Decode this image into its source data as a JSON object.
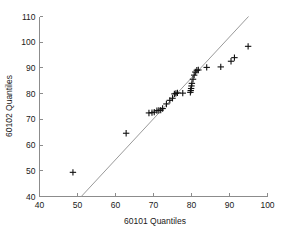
{
  "chart_data": {
    "type": "scatter",
    "title": "",
    "xlabel": "60101 Quantiles",
    "ylabel": "60102 Quantiles",
    "xlim": [
      40,
      100
    ],
    "ylim": [
      40,
      110
    ],
    "xticks": [
      40,
      50,
      60,
      70,
      80,
      90,
      100
    ],
    "yticks": [
      40,
      50,
      60,
      70,
      80,
      90,
      100,
      110
    ],
    "xtick_labels": [
      "40",
      "50",
      "60",
      "70",
      "80",
      "90",
      "100"
    ],
    "ytick_labels": [
      "40",
      "50",
      "60",
      "70",
      "80",
      "90",
      "100",
      "110"
    ],
    "grid": false,
    "legend": "none",
    "marker_style": "plus",
    "marker_color": "#111111",
    "reference_line": {
      "label": "quantile reference line",
      "color": "#9a9a9a",
      "x": [
        51.0,
        95.0
      ],
      "y": [
        40.0,
        110.0
      ]
    },
    "series": [
      {
        "name": "quantile-quantile points",
        "points": [
          [
            48.8,
            49.4
          ],
          [
            62.8,
            64.6
          ],
          [
            68.8,
            72.5
          ],
          [
            69.6,
            72.6
          ],
          [
            70.2,
            72.8
          ],
          [
            70.9,
            73.4
          ],
          [
            71.4,
            73.5
          ],
          [
            71.9,
            73.6
          ],
          [
            72.4,
            74.2
          ],
          [
            73.4,
            76.0
          ],
          [
            74.3,
            77.4
          ],
          [
            75.0,
            78.2
          ],
          [
            75.5,
            79.9
          ],
          [
            75.9,
            80.1
          ],
          [
            76.3,
            80.3
          ],
          [
            77.7,
            80.2
          ],
          [
            79.7,
            80.5
          ],
          [
            79.8,
            81.2
          ],
          [
            79.9,
            82.0
          ],
          [
            80.0,
            83.0
          ],
          [
            80.1,
            84.0
          ],
          [
            80.4,
            85.6
          ],
          [
            80.7,
            87.2
          ],
          [
            81.0,
            88.4
          ],
          [
            81.4,
            89.1
          ],
          [
            81.8,
            89.2
          ],
          [
            84.0,
            90.2
          ],
          [
            87.7,
            90.4
          ],
          [
            90.4,
            92.6
          ],
          [
            91.3,
            94.0
          ],
          [
            94.9,
            98.4
          ]
        ]
      }
    ]
  },
  "axes": {
    "x_title": "60101 Quantiles",
    "y_title": "60102 Quantiles"
  }
}
